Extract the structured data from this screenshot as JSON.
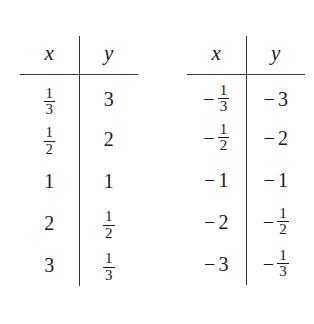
{
  "document": {
    "kind": "math-data-tables",
    "table_count": 2
  },
  "tables": [
    {
      "name": "positive-reciprocal-table",
      "headers": {
        "x": "x",
        "y": "y"
      },
      "rows": [
        {
          "x": {
            "sign": "",
            "type": "fraction",
            "num": "1",
            "den": "3",
            "text": "1/3"
          },
          "y": {
            "sign": "",
            "type": "integer",
            "value": "3",
            "text": "3"
          }
        },
        {
          "x": {
            "sign": "",
            "type": "fraction",
            "num": "1",
            "den": "2",
            "text": "1/2"
          },
          "y": {
            "sign": "",
            "type": "integer",
            "value": "2",
            "text": "2"
          }
        },
        {
          "x": {
            "sign": "",
            "type": "integer",
            "value": "1",
            "text": "1"
          },
          "y": {
            "sign": "",
            "type": "integer",
            "value": "1",
            "text": "1"
          }
        },
        {
          "x": {
            "sign": "",
            "type": "integer",
            "value": "2",
            "text": "2"
          },
          "y": {
            "sign": "",
            "type": "fraction",
            "num": "1",
            "den": "2",
            "text": "1/2"
          }
        },
        {
          "x": {
            "sign": "",
            "type": "integer",
            "value": "3",
            "text": "3"
          },
          "y": {
            "sign": "",
            "type": "fraction",
            "num": "1",
            "den": "3",
            "text": "1/3"
          }
        }
      ]
    },
    {
      "name": "negative-reciprocal-table",
      "headers": {
        "x": "x",
        "y": "y"
      },
      "rows": [
        {
          "x": {
            "sign": "−",
            "type": "fraction",
            "num": "1",
            "den": "3",
            "text": "-1/3"
          },
          "y": {
            "sign": "−",
            "type": "integer",
            "value": "3",
            "text": "-3"
          }
        },
        {
          "x": {
            "sign": "−",
            "type": "fraction",
            "num": "1",
            "den": "2",
            "text": "-1/2"
          },
          "y": {
            "sign": "−",
            "type": "integer",
            "value": "2",
            "text": "-2"
          }
        },
        {
          "x": {
            "sign": "−",
            "type": "integer",
            "value": "1",
            "text": "-1"
          },
          "y": {
            "sign": "−",
            "type": "integer",
            "value": "1",
            "text": "-1"
          }
        },
        {
          "x": {
            "sign": "−",
            "type": "integer",
            "value": "2",
            "text": "-2"
          },
          "y": {
            "sign": "−",
            "type": "fraction",
            "num": "1",
            "den": "2",
            "text": "-1/2"
          }
        },
        {
          "x": {
            "sign": "−",
            "type": "integer",
            "value": "3",
            "text": "-3"
          },
          "y": {
            "sign": "−",
            "type": "fraction",
            "num": "1",
            "den": "3",
            "text": "-1/3"
          }
        }
      ]
    }
  ],
  "colors": {
    "background": "#ffffff",
    "text": "#1a1a1a",
    "rule": "#333333"
  }
}
